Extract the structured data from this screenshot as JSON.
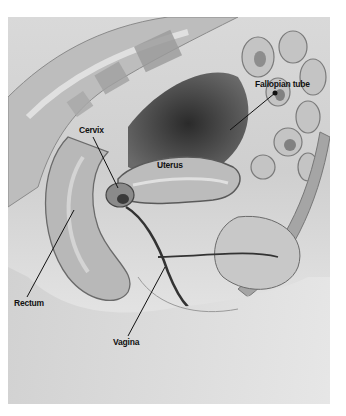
{
  "figure": {
    "type": "anatomical-illustration",
    "style": "grayscale",
    "view": "sagittal section of female pelvis",
    "labels": [
      {
        "id": "fallopian_tube",
        "text": "Fallopian tube",
        "x": 255,
        "y": 80,
        "leader": [
          [
            230,
            130
          ],
          [
            275,
            93
          ]
        ]
      },
      {
        "id": "cervix",
        "text": "Cervix",
        "x": 79,
        "y": 126,
        "leader": [
          [
            93,
            137
          ],
          [
            118,
            188
          ]
        ]
      },
      {
        "id": "uterus",
        "text": "Uterus",
        "x": 157,
        "y": 161,
        "leader": null
      },
      {
        "id": "rectum",
        "text": "Rectum",
        "x": 14,
        "y": 299,
        "leader": [
          [
            27,
            297
          ],
          [
            74,
            210
          ]
        ]
      },
      {
        "id": "vagina",
        "text": "Vagina",
        "x": 113,
        "y": 338,
        "leader": [
          [
            128,
            336
          ],
          [
            165,
            267
          ]
        ]
      }
    ]
  }
}
